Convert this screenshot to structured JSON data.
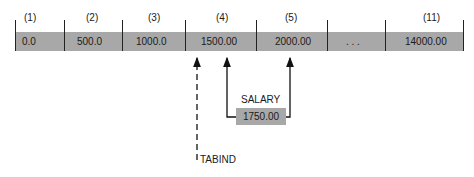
{
  "array": {
    "cells": [
      {
        "index": "(1)",
        "value": "0.0"
      },
      {
        "index": "(2)",
        "value": "500.0"
      },
      {
        "index": "(3)",
        "value": "1000.0"
      },
      {
        "index": "(4)",
        "value": "1500.00"
      },
      {
        "index": "(5)",
        "value": "2000.00"
      },
      {
        "index": "",
        "value": ". . ."
      },
      {
        "index": "(11)",
        "value": "14000.00"
      }
    ]
  },
  "salary": {
    "label": "SALARY",
    "value": "1750.00"
  },
  "tabind": {
    "label": "TABIND"
  },
  "colors": {
    "cell_fill": "#a8a8a8",
    "line": "#222222"
  }
}
